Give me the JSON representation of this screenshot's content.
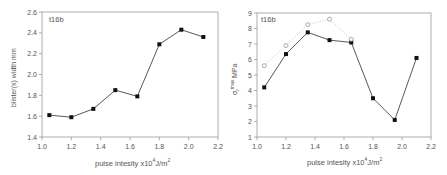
{
  "chart_data": [
    {
      "type": "line",
      "title": "",
      "annotation": "t16b",
      "xlabel": "pulse intesity  x10⁴J/m²",
      "ylabel": "blister(s)  width  mm",
      "xlim": [
        1.0,
        2.2
      ],
      "ylim": [
        1.4,
        2.6
      ],
      "xticks": [
        "1.0",
        "1.2",
        "1.4",
        "1.6",
        "1.8",
        "2.0",
        "2.2"
      ],
      "yticks": [
        "1.4",
        "1.6",
        "1.8",
        "2.0",
        "2.2",
        "2.4",
        "2.6"
      ],
      "grid": false,
      "x": [
        1.05,
        1.2,
        1.35,
        1.5,
        1.65,
        1.8,
        1.95,
        2.1
      ],
      "series": [
        {
          "name": "width",
          "marker": "filled-square",
          "line": "solid",
          "values": [
            1.61,
            1.59,
            1.67,
            1.85,
            1.79,
            2.29,
            2.43,
            2.36
          ]
        }
      ]
    },
    {
      "type": "line",
      "title": "",
      "annotation": "t16b",
      "xlabel": "pulse intesity  x10⁴J/m²",
      "ylabel": "σf max MPa",
      "xlim": [
        1.0,
        2.2
      ],
      "ylim": [
        1,
        9
      ],
      "xticks": [
        "1.0",
        "1.2",
        "1.4",
        "1.6",
        "1.8",
        "2.0",
        "2.2"
      ],
      "yticks": [
        "1",
        "2",
        "3",
        "4",
        "5",
        "6",
        "7",
        "8",
        "9"
      ],
      "grid": false,
      "x": [
        1.05,
        1.2,
        1.35,
        1.5,
        1.65,
        1.8,
        1.95,
        2.1
      ],
      "series": [
        {
          "name": "filled",
          "marker": "filled-square",
          "line": "solid",
          "values": [
            4.2,
            6.35,
            7.75,
            7.25,
            7.1,
            3.5,
            2.1,
            6.1
          ]
        },
        {
          "name": "open",
          "marker": "open-circle",
          "line": "dotted",
          "values": [
            5.6,
            6.9,
            8.25,
            8.6,
            7.3,
            null,
            null,
            null
          ]
        }
      ]
    }
  ],
  "left": {
    "tag": "t16b",
    "xlabel_main": "pulse intesity  x10",
    "xlabel_sup": "4",
    "xlabel_unit": "J/m",
    "xlabel_sup2": "2",
    "ylabel": "blister(s)  width  mm"
  },
  "right": {
    "tag": "t16b",
    "xlabel_main": "pulse intesity  x10",
    "xlabel_sup": "4",
    "xlabel_unit": "J/m",
    "xlabel_sup2": "2",
    "ylabel_sigma": "σ",
    "ylabel_sub": "f",
    "ylabel_sup": "max",
    "ylabel_unit": " MPa"
  }
}
